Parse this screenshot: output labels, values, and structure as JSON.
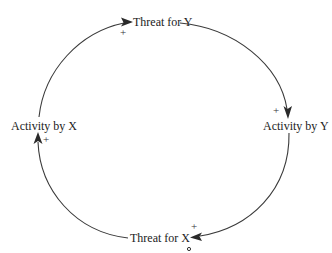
{
  "diagram": {
    "type": "causal-loop",
    "nodes": [
      {
        "id": "threat_y",
        "label": "Threat for Y"
      },
      {
        "id": "activity_y",
        "label": "Activity by Y"
      },
      {
        "id": "threat_x",
        "label": "Threat for X"
      },
      {
        "id": "activity_x",
        "label": "Activity by X"
      }
    ],
    "links": [
      {
        "from": "Activity by X",
        "to": "Threat for Y",
        "polarity": "+"
      },
      {
        "from": "Threat for Y",
        "to": "Activity by Y",
        "polarity": "+"
      },
      {
        "from": "Activity by Y",
        "to": "Threat for X",
        "polarity": "+"
      },
      {
        "from": "Threat for X",
        "to": "Activity by X",
        "polarity": "+"
      }
    ],
    "marker": {
      "near": "Threat for X",
      "symbol": "o"
    },
    "colors": {
      "line": "#3a3a3a",
      "text": "#222222",
      "background": "#ffffff"
    }
  }
}
